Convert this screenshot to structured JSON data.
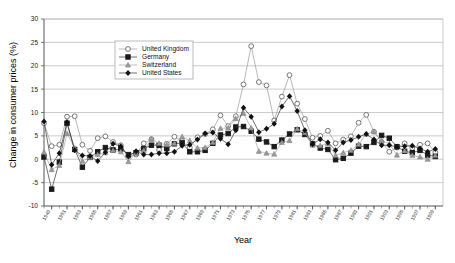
{
  "chart_data": {
    "type": "line",
    "title": "",
    "xlabel": "Year",
    "ylabel": "Change in consumer prices (%)",
    "xlim": [
      1948,
      2000
    ],
    "ylim": [
      -10,
      30
    ],
    "yticks": [
      -10,
      -5,
      0,
      5,
      10,
      15,
      20,
      25,
      30
    ],
    "grid": "horizontal",
    "legend_position": "top-center-left",
    "x": [
      1948,
      1949,
      1950,
      1951,
      1952,
      1953,
      1954,
      1955,
      1956,
      1957,
      1958,
      1959,
      1960,
      1961,
      1962,
      1963,
      1964,
      1965,
      1966,
      1967,
      1968,
      1969,
      1970,
      1971,
      1972,
      1973,
      1974,
      1975,
      1976,
      1977,
      1978,
      1979,
      1980,
      1981,
      1982,
      1983,
      1984,
      1985,
      1986,
      1987,
      1988,
      1989,
      1990,
      1991,
      1992,
      1993,
      1994,
      1995,
      1996,
      1997,
      1998,
      1999
    ],
    "xticks": [
      1949,
      1951,
      1953,
      1955,
      1957,
      1959,
      1961,
      1963,
      1965,
      1967,
      1969,
      1971,
      1973,
      1975,
      1977,
      1979,
      1981,
      1983,
      1985,
      1987,
      1989,
      1991,
      1993,
      1995,
      1997,
      1999
    ],
    "xtick_labels": [
      "1949",
      "1951",
      "1953",
      "1955",
      "1957",
      "1959",
      "1961",
      "1963",
      "1965",
      "1967",
      "1969",
      "1971",
      "1973",
      "1975",
      "1977",
      "1979",
      "1981",
      "1983",
      "1985",
      "1987",
      "1989",
      "1991",
      "1993",
      "1995",
      "1997",
      "1999"
    ],
    "series": [
      {
        "name": "United Kingdom",
        "marker": "open-circle",
        "color": "#888888",
        "values": [
          7.7,
          2.8,
          3.1,
          9.1,
          9.2,
          3.1,
          1.8,
          4.5,
          4.9,
          3.7,
          3.0,
          0.6,
          1.0,
          3.4,
          4.3,
          2.0,
          3.3,
          4.8,
          3.9,
          2.5,
          4.7,
          5.4,
          6.4,
          9.4,
          7.1,
          9.2,
          16.0,
          24.2,
          16.5,
          15.8,
          8.3,
          13.4,
          18.0,
          11.9,
          8.6,
          4.6,
          5.0,
          6.1,
          3.4,
          4.2,
          4.9,
          7.8,
          9.5,
          5.9,
          3.7,
          1.6,
          2.5,
          3.4,
          2.4,
          3.1,
          3.4,
          1.5
        ]
      },
      {
        "name": "Germany",
        "marker": "filled-square",
        "color": "#1a1a1a",
        "values": [
          0.5,
          -6.4,
          -0.6,
          7.7,
          2.1,
          -1.7,
          0.4,
          1.6,
          2.5,
          2.0,
          2.2,
          1.0,
          1.4,
          2.3,
          3.0,
          3.0,
          2.3,
          3.3,
          3.5,
          1.6,
          1.6,
          1.9,
          3.4,
          5.2,
          5.5,
          6.9,
          7.0,
          6.0,
          4.3,
          3.7,
          2.7,
          4.1,
          5.4,
          6.3,
          5.3,
          3.3,
          2.4,
          2.1,
          -0.1,
          0.2,
          1.3,
          2.8,
          2.7,
          3.6,
          5.1,
          4.5,
          2.7,
          1.7,
          1.4,
          1.9,
          0.9,
          0.6
        ]
      },
      {
        "name": "Switzerland",
        "marker": "filled-triangle",
        "color": "#9a9a9a",
        "values": [
          1.5,
          -2.2,
          -1.3,
          5.5,
          2.4,
          -0.4,
          0.4,
          1.0,
          1.4,
          1.9,
          1.6,
          -0.5,
          1.4,
          1.9,
          4.3,
          3.4,
          3.1,
          3.4,
          4.8,
          4.0,
          2.4,
          2.5,
          3.6,
          6.6,
          6.7,
          8.7,
          9.8,
          6.7,
          1.7,
          1.3,
          1.1,
          3.6,
          4.0,
          6.5,
          5.7,
          3.0,
          2.9,
          3.4,
          0.8,
          1.4,
          1.9,
          3.2,
          5.4,
          5.9,
          4.0,
          3.3,
          0.9,
          1.8,
          0.8,
          0.5,
          0.0,
          0.8
        ]
      },
      {
        "name": "United States",
        "marker": "filled-diamond",
        "color": "#111111",
        "values": [
          8.1,
          -1.2,
          1.3,
          7.9,
          1.9,
          0.8,
          0.7,
          -0.4,
          1.5,
          3.3,
          2.8,
          0.7,
          1.7,
          1.0,
          1.0,
          1.3,
          1.3,
          1.6,
          2.9,
          3.1,
          4.2,
          5.5,
          5.7,
          4.4,
          3.2,
          6.2,
          11.0,
          9.1,
          5.8,
          6.5,
          7.6,
          11.3,
          13.5,
          10.3,
          6.2,
          3.2,
          4.3,
          3.6,
          1.9,
          3.6,
          4.1,
          4.8,
          5.4,
          4.2,
          3.0,
          3.0,
          2.6,
          2.8,
          2.9,
          2.3,
          1.6,
          2.2
        ]
      }
    ]
  },
  "axes": {
    "ylabel": "Change in consumer prices (%)",
    "xlabel": "Year"
  },
  "legend": {
    "entries": [
      {
        "label": "United Kingdom"
      },
      {
        "label": "Germany"
      },
      {
        "label": "Switzerland"
      },
      {
        "label": "United States"
      }
    ]
  }
}
